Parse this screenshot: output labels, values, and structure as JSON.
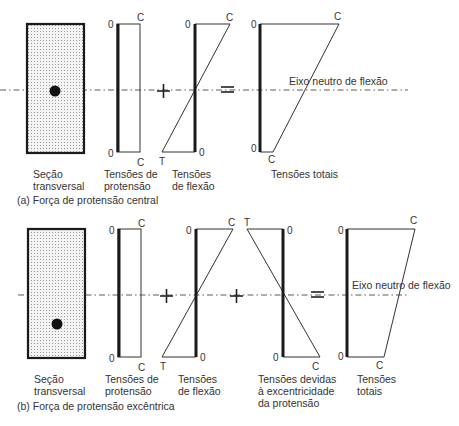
{
  "figure": {
    "parts": [
      {
        "id": "a",
        "caption": "(a) Força de protensão central",
        "section_label": [
          "Seção",
          "transversal"
        ],
        "prestress_label": [
          "Tensões de",
          "protensão"
        ],
        "flexure_label": [
          "Tensões",
          "de flexão"
        ],
        "total_label": [
          "Tensões totais"
        ],
        "axis_label": "Eixo neutro de flexão",
        "operators": [
          "+",
          "="
        ],
        "prestress_marks": {
          "top_zero": "0",
          "top": "C",
          "bottom_zero": "0",
          "bottom": "C"
        },
        "flexure_marks": {
          "top_zero": "0",
          "top": "C",
          "bottom_zero": "0",
          "bottom": "T"
        },
        "total_marks": {
          "top_zero": "0",
          "top": "C",
          "bottom_zero": "0",
          "bottom": "C"
        }
      },
      {
        "id": "b",
        "caption": "(b) Força de protensão excêntrica",
        "section_label": [
          "Seção",
          "transversal"
        ],
        "prestress_label": [
          "Tensões de",
          "protensão"
        ],
        "flexure_label": [
          "Tensões",
          "de flexão"
        ],
        "eccentric_label": [
          "Tensões devidas",
          "à excentricidade",
          "da protensão"
        ],
        "total_label": [
          "Tensões",
          "totais"
        ],
        "axis_label": "Eixo neutro de flexão",
        "operators": [
          "+",
          "+",
          "="
        ],
        "prestress_marks": {
          "top_zero": "0",
          "top": "C",
          "bottom_zero": "0",
          "bottom": "C"
        },
        "flexure_marks": {
          "top_zero": "0",
          "top": "C",
          "bottom_zero": "0",
          "bottom": "T"
        },
        "eccentric_marks": {
          "top_zero": "0",
          "top": "T",
          "bottom_zero": "0",
          "bottom": "C"
        },
        "total_marks": {
          "top_zero": "0",
          "top": "C",
          "bottom_zero": "0",
          "bottom": "C"
        }
      }
    ]
  }
}
